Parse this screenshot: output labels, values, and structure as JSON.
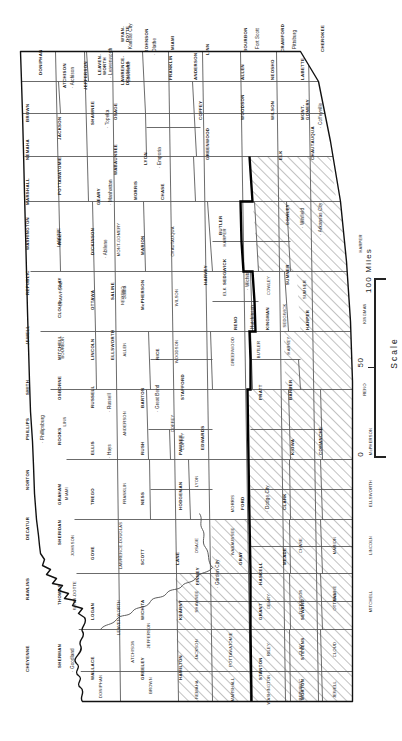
{
  "map": {
    "title_visible": false,
    "subject": "Kansas counties",
    "orientation_note": "map rendered rotated 90 degrees counter-clockwise",
    "colors": {
      "outline": "#1a1a1a",
      "county_line": "#555555",
      "thick_boundary": "#000000",
      "hatch": "#8a8a8a",
      "background": "#ffffff",
      "text": "#1a1a1a"
    },
    "scale": {
      "label": "Scale",
      "unit_label": "100 Miles",
      "ticks": [
        "0",
        "50",
        "100 Miles"
      ]
    },
    "counties": [
      {
        "id": "cheyenne",
        "name": "CHEYENNE",
        "hatched": true
      },
      {
        "id": "rawlins",
        "name": "RAWLINS",
        "hatched": true
      },
      {
        "id": "decatur",
        "name": "DECATUR",
        "hatched": false
      },
      {
        "id": "norton",
        "name": "NORTON",
        "hatched": false
      },
      {
        "id": "phillips",
        "name": "PHILLIPS",
        "hatched": false
      },
      {
        "id": "smith",
        "name": "SMITH",
        "hatched": false
      },
      {
        "id": "jewell",
        "name": "JEWELL",
        "hatched": false
      },
      {
        "id": "republic",
        "name": "REPUBLIC",
        "hatched": false
      },
      {
        "id": "washington",
        "name": "WASHINGTON",
        "hatched": false
      },
      {
        "id": "marshall",
        "name": "MARSHALL",
        "hatched": false
      },
      {
        "id": "nemaha",
        "name": "NEMAHA",
        "hatched": false
      },
      {
        "id": "brown",
        "name": "BROWN",
        "hatched": false
      },
      {
        "id": "doniphan",
        "name": "DONIPHAN",
        "hatched": false
      },
      {
        "id": "sherman",
        "name": "SHERMAN",
        "hatched": true
      },
      {
        "id": "thomas",
        "name": "THOMAS",
        "hatched": true
      },
      {
        "id": "sheridan",
        "name": "SHERIDAN",
        "hatched": false
      },
      {
        "id": "graham",
        "name": "GRAHAM",
        "hatched": false
      },
      {
        "id": "rooks",
        "name": "ROOKS",
        "hatched": false
      },
      {
        "id": "osborne",
        "name": "OSBORNE",
        "hatched": false
      },
      {
        "id": "mitchell",
        "name": "MITCHELL",
        "hatched": false
      },
      {
        "id": "cloud",
        "name": "CLOUD",
        "hatched": false
      },
      {
        "id": "clay",
        "name": "CLAY",
        "hatched": false
      },
      {
        "id": "riley",
        "name": "RILEY",
        "hatched": false
      },
      {
        "id": "pottawatomie",
        "name": "POTTAWATOMIE",
        "hatched": false
      },
      {
        "id": "jackson",
        "name": "JACKSON",
        "hatched": false
      },
      {
        "id": "atchison",
        "name": "ATCHISON",
        "hatched": false
      },
      {
        "id": "leavenworth",
        "name": "LEAVEN-WORTH",
        "hatched": false
      },
      {
        "id": "jefferson",
        "name": "JEFFERSON",
        "hatched": false
      },
      {
        "id": "wyandotte",
        "name": "WYAN-DOTTE",
        "hatched": false
      },
      {
        "id": "wallace",
        "name": "WALLACE",
        "hatched": true
      },
      {
        "id": "logan",
        "name": "LOGAN",
        "hatched": true
      },
      {
        "id": "gove",
        "name": "GOVE",
        "hatched": true
      },
      {
        "id": "trego",
        "name": "TREGO",
        "hatched": false
      },
      {
        "id": "ellis",
        "name": "ELLIS",
        "hatched": false
      },
      {
        "id": "russell",
        "name": "RUSSELL",
        "hatched": false
      },
      {
        "id": "lincoln",
        "name": "LINCOLN",
        "hatched": false
      },
      {
        "id": "ottawa",
        "name": "OTTAWA",
        "hatched": false
      },
      {
        "id": "dickinson",
        "name": "DICKINSON",
        "hatched": false
      },
      {
        "id": "geary",
        "name": "GEARY",
        "hatched": false
      },
      {
        "id": "wabaunsee",
        "name": "WABAUNSEE",
        "hatched": false
      },
      {
        "id": "shawnee",
        "name": "SHAWNEE",
        "hatched": false
      },
      {
        "id": "douglas",
        "name": "LAWRENCE-DOUGLAS",
        "hatched": false
      },
      {
        "id": "johnson",
        "name": "JOHNSON",
        "hatched": false
      },
      {
        "id": "greeley",
        "name": "GREELEY",
        "hatched": true
      },
      {
        "id": "wichita",
        "name": "WICHITA",
        "hatched": true
      },
      {
        "id": "scott",
        "name": "SCOTT",
        "hatched": true
      },
      {
        "id": "lane",
        "name": "LANE",
        "hatched": true
      },
      {
        "id": "ness",
        "name": "NESS",
        "hatched": false
      },
      {
        "id": "rush",
        "name": "RUSH",
        "hatched": false
      },
      {
        "id": "barton",
        "name": "BARTON",
        "hatched": false
      },
      {
        "id": "ellsworth",
        "name": "ELLSWORTH",
        "hatched": false
      },
      {
        "id": "saline",
        "name": "SALINE",
        "hatched": false
      },
      {
        "id": "morris",
        "name": "MORRIS",
        "hatched": false
      },
      {
        "id": "osage",
        "name": "OSAGE",
        "hatched": false
      },
      {
        "id": "franklin",
        "name": "FRANKLIN",
        "hatched": false
      },
      {
        "id": "miami",
        "name": "MIAMI",
        "hatched": false
      },
      {
        "id": "hamilton",
        "name": "HAMILTON",
        "hatched": true
      },
      {
        "id": "kearny",
        "name": "KEARNY",
        "hatched": true
      },
      {
        "id": "finney",
        "name": "FINNEY",
        "hatched": true
      },
      {
        "id": "hodgeman",
        "name": "HODGEMAN",
        "hatched": false
      },
      {
        "id": "pawnee",
        "name": "PAWNEE",
        "hatched": false
      },
      {
        "id": "stafford",
        "name": "STAFFORD",
        "hatched": false
      },
      {
        "id": "rice",
        "name": "RICE",
        "hatched": false
      },
      {
        "id": "mcpherson",
        "name": "McPHERSON",
        "hatched": false
      },
      {
        "id": "marion",
        "name": "MARION",
        "hatched": false
      },
      {
        "id": "chase",
        "name": "CHASE",
        "hatched": false
      },
      {
        "id": "lyon",
        "name": "LYON",
        "hatched": false
      },
      {
        "id": "coffey",
        "name": "COFFEY",
        "hatched": false
      },
      {
        "id": "anderson",
        "name": "ANDERSON",
        "hatched": false
      },
      {
        "id": "linn",
        "name": "LINN",
        "hatched": false
      },
      {
        "id": "stanton",
        "name": "STANTON",
        "hatched": true
      },
      {
        "id": "grant",
        "name": "GRANT",
        "hatched": true
      },
      {
        "id": "haskell",
        "name": "HASKELL",
        "hatched": true
      },
      {
        "id": "gray",
        "name": "GRAY",
        "hatched": true
      },
      {
        "id": "ford",
        "name": "FORD",
        "hatched": false
      },
      {
        "id": "edwards",
        "name": "EDWARDS",
        "hatched": false
      },
      {
        "id": "pratt",
        "name": "PRATT",
        "hatched": false
      },
      {
        "id": "reno",
        "name": "RENO",
        "hatched": false
      },
      {
        "id": "harvey",
        "name": "HARVEY",
        "hatched": false
      },
      {
        "id": "butler",
        "name": "BUTLER",
        "hatched": false
      },
      {
        "id": "greenwood",
        "name": "GREENWOOD",
        "hatched": false
      },
      {
        "id": "woodson",
        "name": "WOODSON",
        "hatched": false
      },
      {
        "id": "allen",
        "name": "ALLEN",
        "hatched": false
      },
      {
        "id": "bourbon",
        "name": "BOURBON",
        "hatched": false
      },
      {
        "id": "morton",
        "name": "MORTON",
        "hatched": true
      },
      {
        "id": "stevens",
        "name": "STEVENS",
        "hatched": true
      },
      {
        "id": "seward",
        "name": "SEWARD",
        "hatched": true
      },
      {
        "id": "meade",
        "name": "MEADE",
        "hatched": true
      },
      {
        "id": "clark",
        "name": "CLARK",
        "hatched": true
      },
      {
        "id": "comanche",
        "name": "COMANCHE",
        "hatched": true
      },
      {
        "id": "kiowa",
        "name": "KIOWA",
        "hatched": true
      },
      {
        "id": "barber",
        "name": "BARBER",
        "hatched": false
      },
      {
        "id": "kingman",
        "name": "KINGMAN",
        "hatched": false
      },
      {
        "id": "sedgwick",
        "name": "SEDGWICK",
        "hatched": false
      },
      {
        "id": "harper",
        "name": "HARPER",
        "hatched": false
      },
      {
        "id": "sumner",
        "name": "SUMNER",
        "hatched": false
      },
      {
        "id": "cowley",
        "name": "COWLEY",
        "hatched": false
      },
      {
        "id": "elk",
        "name": "ELK",
        "hatched": false
      },
      {
        "id": "wilson",
        "name": "WILSON",
        "hatched": false
      },
      {
        "id": "neosho",
        "name": "NEOSHO",
        "hatched": false
      },
      {
        "id": "crawford",
        "name": "CRAWFORD",
        "hatched": false
      },
      {
        "id": "chautauqua",
        "name": "CHAUTAUQUA",
        "hatched": false
      },
      {
        "id": "montgomery",
        "name": "MONT-GOMERY",
        "hatched": false
      },
      {
        "id": "labette",
        "name": "LABETTE",
        "hatched": false
      },
      {
        "id": "cherokee",
        "name": "CHEROKEE",
        "hatched": false
      }
    ],
    "cities": [
      {
        "id": "goodland",
        "name": "Goodland"
      },
      {
        "id": "dodge-city",
        "name": "Dodge City"
      },
      {
        "id": "garden-city",
        "name": "Garden City"
      },
      {
        "id": "hays",
        "name": "Hays"
      },
      {
        "id": "russell-city",
        "name": "Russell"
      },
      {
        "id": "great-bend",
        "name": "Great Bend"
      },
      {
        "id": "phillipsburg",
        "name": "Phillipsburg"
      },
      {
        "id": "hutchinson",
        "name": "Hutchinson"
      },
      {
        "id": "wichita-city",
        "name": "Wichita"
      },
      {
        "id": "winfield",
        "name": "Winfield"
      },
      {
        "id": "arkansas-city",
        "name": "Arkansas City"
      },
      {
        "id": "coffeyville",
        "name": "Coffeyville"
      },
      {
        "id": "pittsburg",
        "name": "Pittsburg"
      },
      {
        "id": "fort-scott",
        "name": "Fort Scott"
      },
      {
        "id": "olathe",
        "name": "Olathe"
      },
      {
        "id": "kansas-city",
        "name": "Kansas City"
      },
      {
        "id": "leavenworth-city",
        "name": "Leavenworth"
      },
      {
        "id": "topeka",
        "name": "Topeka"
      },
      {
        "id": "lawrence",
        "name": "Lawrence"
      },
      {
        "id": "manhattan",
        "name": "Manhattan"
      },
      {
        "id": "abilene",
        "name": "Abilene"
      },
      {
        "id": "salina-city",
        "name": "Salina"
      },
      {
        "id": "emporia",
        "name": "Emporia"
      },
      {
        "id": "atchison-city",
        "name": "Atchison"
      }
    ]
  }
}
